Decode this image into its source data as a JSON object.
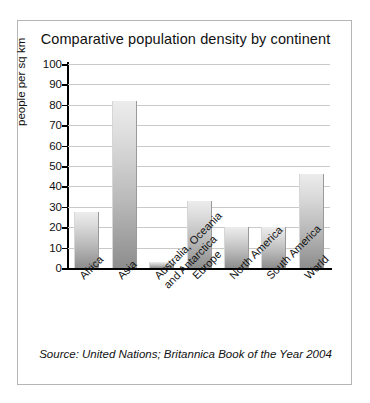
{
  "figure": {
    "title": "Comparative population density by continent",
    "source_note": "Source: United Nations; Britannica Book of the Year 2004"
  },
  "axis": {
    "y_title": "people per sq km",
    "y_ticks": [
      "100",
      "90",
      "80",
      "70",
      "60",
      "50",
      "40",
      "30",
      "20",
      "10",
      "0"
    ]
  },
  "colors": {
    "bar_top": "#ececec",
    "bar_bottom": "#8d8d8d",
    "gridline": "#c9c9c9",
    "axis": "#000000",
    "frame": "#b5b5b5",
    "text": "#111111"
  },
  "chart_data": {
    "type": "bar",
    "title": "Comparative population density by continent",
    "xlabel": "",
    "ylabel": "people per sq km",
    "ylim": [
      0,
      100
    ],
    "ytick_step": 10,
    "grid": true,
    "legend": false,
    "categories": [
      "Africa",
      "Asia",
      "Australia, Oceania\nand Antarctica",
      "Europe",
      "North America",
      "South America",
      "World"
    ],
    "category_lines": [
      [
        "Africa"
      ],
      [
        "Asia"
      ],
      [
        "Australia, Oceania",
        "and Antarctica"
      ],
      [
        "Europe"
      ],
      [
        "North America"
      ],
      [
        "South America"
      ],
      [
        "World"
      ]
    ],
    "values": [
      27.5,
      82,
      3,
      33,
      20,
      20,
      46
    ],
    "annotations": [
      "Source: United Nations; Britannica Book of the Year 2004"
    ]
  }
}
